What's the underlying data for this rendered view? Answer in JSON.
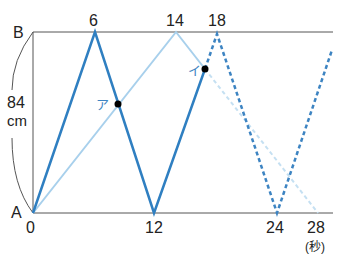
{
  "diagram": {
    "type": "distance-time graph (two movers between A and B)",
    "labels": {
      "top_point": "B",
      "bottom_point": "A",
      "distance_value": "84",
      "distance_unit": "cm",
      "time_unit": "(秒)",
      "point_a": "ア",
      "point_i": "イ"
    },
    "time_ticks_top": [
      "6",
      "14",
      "18"
    ],
    "time_ticks_bottom": [
      "0",
      "12",
      "24",
      "28"
    ],
    "colors": {
      "dark_blue": "#2f7fc1",
      "light_blue": "#a8d0ec",
      "axis": "#555555",
      "dot": "#000000"
    },
    "series": [
      {
        "name": "dark-solid",
        "style": "solid",
        "points": [
          [
            0,
            0
          ],
          [
            6,
            84
          ],
          [
            12,
            0
          ],
          [
            17,
            70
          ]
        ]
      },
      {
        "name": "dark-dashed",
        "style": "dashed",
        "points": [
          [
            17,
            70
          ],
          [
            18,
            84
          ],
          [
            24,
            0
          ],
          [
            28,
            78
          ]
        ]
      },
      {
        "name": "light-solid",
        "style": "solid",
        "points": [
          [
            0,
            0
          ],
          [
            14,
            84
          ],
          [
            17,
            66
          ]
        ]
      },
      {
        "name": "light-dashed",
        "style": "dashed",
        "points": [
          [
            17,
            66
          ],
          [
            28,
            0
          ]
        ]
      }
    ],
    "marked_points": [
      {
        "label": "ア",
        "approx_t": 8.4
      },
      {
        "label": "イ",
        "approx_t": 17
      }
    ]
  }
}
